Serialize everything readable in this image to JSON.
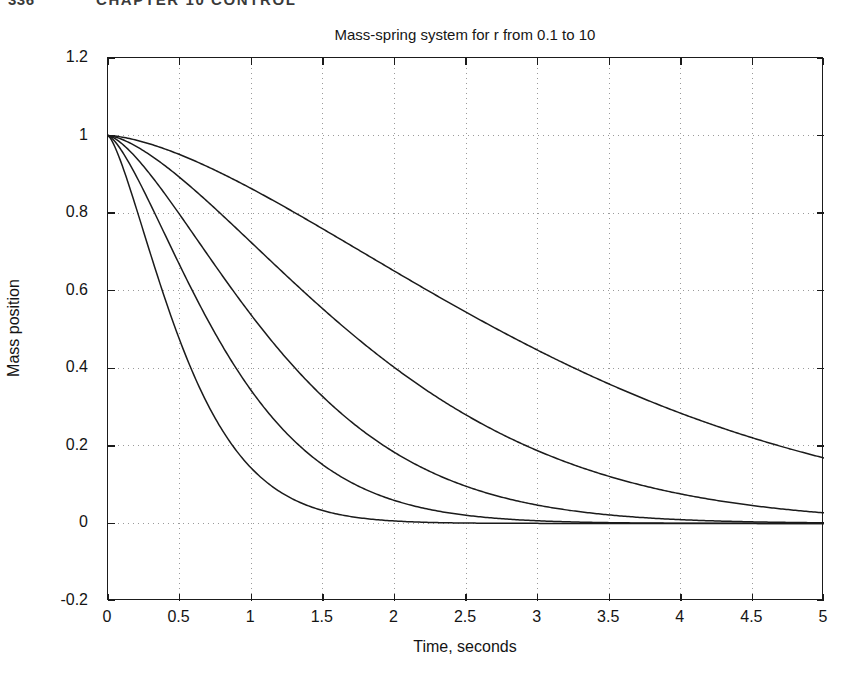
{
  "page": {
    "folio": "336",
    "running_head": "CHAPTER 10   CONTROL"
  },
  "figure": {
    "title": "Mass-spring system for r from 0.1 to 10",
    "xlabel": "Time, seconds",
    "ylabel": "Mass position",
    "line_color": "#1b1b1b",
    "grid_color": "#9a9a9a",
    "axis_color": "#1b1b1b",
    "background": "#ffffff"
  },
  "chart_data": {
    "type": "line",
    "title": "Mass-spring system for r from 0.1 to 10",
    "xlabel": "Time, seconds",
    "ylabel": "Mass position",
    "xlim": [
      0,
      5
    ],
    "ylim": [
      -0.2,
      1.2
    ],
    "xticks": [
      0,
      0.5,
      1,
      1.5,
      2,
      2.5,
      3,
      3.5,
      4,
      4.5,
      5
    ],
    "xtick_labels": [
      "0",
      "0.5",
      "1",
      "1.5",
      "2",
      "2.5",
      "3",
      "3.5",
      "4",
      "4.5",
      "5"
    ],
    "yticks": [
      -0.2,
      0,
      0.2,
      0.4,
      0.6,
      0.8,
      1,
      1.2
    ],
    "ytick_labels": [
      "-0.2",
      "0",
      "0.2",
      "0.4",
      "0.6",
      "0.8",
      "1",
      "1.2"
    ],
    "grid": true,
    "grid_style": "dotted",
    "legend": "none",
    "x": [
      0,
      0.1,
      0.2,
      0.3,
      0.4,
      0.5,
      0.6,
      0.7,
      0.8,
      0.9,
      1,
      1.1,
      1.2,
      1.3,
      1.4,
      1.5,
      1.6,
      1.7,
      1.8,
      1.9,
      2,
      2.1,
      2.2,
      2.3,
      2.4,
      2.5,
      2.6,
      2.7,
      2.8,
      2.9,
      3,
      3.1,
      3.2,
      3.3,
      3.4,
      3.5,
      3.6,
      3.7,
      3.8,
      3.9,
      4,
      4.1,
      4.2,
      4.3,
      4.4,
      4.5,
      4.6,
      4.7,
      4.8,
      4.9,
      5
    ],
    "series": [
      {
        "name": "r = 10",
        "r": 10,
        "decay_rate": 0.29,
        "shape_exponent": 1.55,
        "values": [
          1,
          0.998,
          0.993,
          0.986,
          0.977,
          0.967,
          0.955,
          0.942,
          0.928,
          0.913,
          0.897,
          0.88,
          0.863,
          0.845,
          0.827,
          0.808,
          0.789,
          0.769,
          0.749,
          0.729,
          0.709,
          0.688,
          0.668,
          0.647,
          0.627,
          0.606,
          0.586,
          0.566,
          0.546,
          0.526,
          0.507,
          0.488,
          0.469,
          0.451,
          0.433,
          0.415,
          0.398,
          0.381,
          0.365,
          0.349,
          0.334,
          0.319,
          0.305,
          0.291,
          0.278,
          0.265,
          0.253,
          0.241,
          0.23,
          0.239,
          0.232
        ]
      },
      {
        "name": "r = 3.16",
        "r": 3.1623,
        "decay_rate": 0.47,
        "shape_exponent": 1.5,
        "values": [
          1,
          0.995,
          0.985,
          0.97,
          0.952,
          0.932,
          0.909,
          0.885,
          0.859,
          0.833,
          0.805,
          0.777,
          0.749,
          0.72,
          0.692,
          0.663,
          0.635,
          0.607,
          0.579,
          0.552,
          0.525,
          0.499,
          0.473,
          0.449,
          0.425,
          0.401,
          0.379,
          0.357,
          0.336,
          0.316,
          0.297,
          0.279,
          0.261,
          0.245,
          0.229,
          0.214,
          0.2,
          0.186,
          0.174,
          0.162,
          0.151,
          0.14,
          0.13,
          0.121,
          0.112,
          0.104,
          0.096,
          0.089,
          0.082,
          0.076,
          0.07
        ]
      },
      {
        "name": "r = 1",
        "r": 1,
        "decay_rate": 0.72,
        "shape_exponent": 1.45,
        "values": [
          1,
          0.991,
          0.974,
          0.951,
          0.923,
          0.892,
          0.859,
          0.824,
          0.788,
          0.752,
          0.715,
          0.679,
          0.643,
          0.608,
          0.573,
          0.54,
          0.507,
          0.476,
          0.446,
          0.417,
          0.389,
          0.363,
          0.338,
          0.314,
          0.292,
          0.271,
          0.251,
          0.232,
          0.214,
          0.198,
          0.182,
          0.168,
          0.154,
          0.142,
          0.13,
          0.119,
          0.109,
          0.1,
          0.091,
          0.083,
          0.076,
          0.069,
          0.063,
          0.057,
          0.052,
          0.047,
          0.043,
          0.039,
          0.035,
          0.032,
          0.029
        ]
      },
      {
        "name": "r = 0.316",
        "r": 0.3162,
        "decay_rate": 1.05,
        "shape_exponent": 1.4,
        "values": [
          1,
          0.985,
          0.96,
          0.928,
          0.89,
          0.849,
          0.806,
          0.762,
          0.718,
          0.674,
          0.631,
          0.589,
          0.548,
          0.509,
          0.471,
          0.436,
          0.402,
          0.37,
          0.339,
          0.311,
          0.285,
          0.26,
          0.237,
          0.216,
          0.196,
          0.178,
          0.161,
          0.146,
          0.132,
          0.119,
          0.107,
          0.096,
          0.086,
          0.077,
          0.069,
          0.062,
          0.055,
          0.049,
          0.044,
          0.039,
          0.035,
          0.031,
          0.027,
          0.024,
          0.021,
          0.019,
          0.017,
          0.015,
          0.013,
          0.011,
          0.01
        ]
      },
      {
        "name": "r = 0.1",
        "r": 0.1,
        "decay_rate": 1.62,
        "shape_exponent": 1.38,
        "values": [
          1,
          0.976,
          0.937,
          0.889,
          0.835,
          0.777,
          0.718,
          0.659,
          0.601,
          0.545,
          0.492,
          0.442,
          0.395,
          0.352,
          0.312,
          0.276,
          0.243,
          0.213,
          0.186,
          0.162,
          0.141,
          0.122,
          0.105,
          0.09,
          0.077,
          0.065,
          0.055,
          0.047,
          0.039,
          0.033,
          0.028,
          0.023,
          0.019,
          0.016,
          0.013,
          0.011,
          0.009,
          0.007,
          0.006,
          0.005,
          0.004,
          0.003,
          0.003,
          0.002,
          0.002,
          0.001,
          0.001,
          0.001,
          0.001,
          0.001,
          0
        ]
      }
    ]
  }
}
